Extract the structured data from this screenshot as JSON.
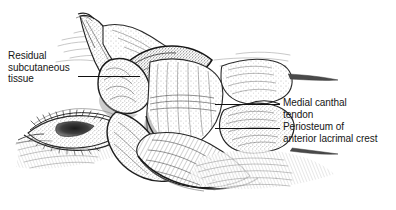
{
  "figure": {
    "type": "medical-illustration",
    "style": "pen-and-ink stipple line drawing",
    "background_color": "#ffffff",
    "ink_color": "#1a1a1a"
  },
  "labels": {
    "residual_subcutaneous_tissue": {
      "line1": "Residual",
      "line2": "subcutaneous",
      "line3": "tissue"
    },
    "medial_canthal_tendon": {
      "line1": "Medial canthal",
      "line2": "tendon"
    },
    "periosteum_of_anterior_lacrimal_crest": {
      "line1": "Periosteum of",
      "line2": "anterior lacrimal crest"
    }
  },
  "leaders": {
    "residual": {
      "x1": 78,
      "y1": 76,
      "x2": 140,
      "y2": 76
    },
    "tendon": {
      "x1": 215,
      "y1": 104,
      "x2": 280,
      "y2": 104
    },
    "periosteum": {
      "x1": 215,
      "y1": 128,
      "x2": 280,
      "y2": 128
    }
  }
}
